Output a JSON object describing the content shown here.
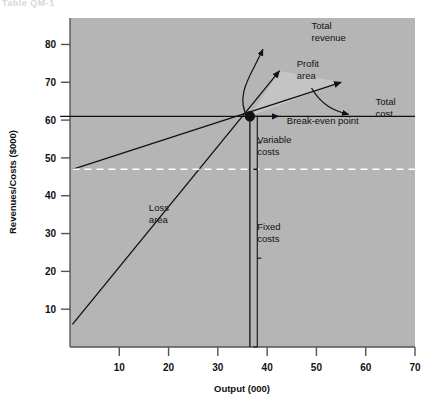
{
  "figure": {
    "ghost_caption": "Table QM-1"
  },
  "chart_data": {
    "type": "line",
    "title": "",
    "xlabel": "Output (000)",
    "ylabel": "Revenues/Costs ($000)",
    "xlim": [
      0,
      70
    ],
    "ylim": [
      0,
      87
    ],
    "xticks": [
      10,
      20,
      30,
      40,
      50,
      60,
      70
    ],
    "yticks": [
      10,
      20,
      30,
      40,
      50,
      60,
      70,
      80
    ],
    "grid": false,
    "legend": "none",
    "plot_background": "#b5b5b5",
    "series": [
      {
        "name": "Total revenue",
        "kind": "line",
        "x": [
          0.5,
          42.5
        ],
        "y": [
          6.0,
          73.0
        ],
        "arrow_end": true
      },
      {
        "name": "Total cost",
        "kind": "line",
        "x": [
          0.5,
          55.0
        ],
        "y": [
          47.0,
          70.0
        ],
        "arrow_end": true
      },
      {
        "name": "Fixed costs",
        "kind": "dashed-horizontal",
        "x": [
          0.5,
          70.0
        ],
        "y": [
          47.0,
          47.0
        ],
        "color": "#ffffff"
      },
      {
        "name": "Break-even revenue level",
        "kind": "horizontal",
        "x": [
          -2.0,
          70.0
        ],
        "y": [
          61.0,
          61.0
        ]
      },
      {
        "name": "Break-even output drop line",
        "kind": "vertical",
        "x": [
          36.5,
          36.5
        ],
        "y": [
          0.0,
          61.0
        ]
      }
    ],
    "points": [
      {
        "name": "Break-even point",
        "x": 36.5,
        "y": 61.0,
        "marker": "filled-circle"
      }
    ],
    "annotations": [
      {
        "name": "total-revenue-label",
        "text": "Total revenue",
        "lines": [
          "Total",
          "revenue"
        ],
        "x": 49,
        "y": 84
      },
      {
        "name": "profit-area-label",
        "text": "Profit area",
        "lines": [
          "Profit",
          "area"
        ],
        "x": 46,
        "y": 74
      },
      {
        "name": "total-cost-label",
        "text": "Total cost",
        "lines": [
          "Total",
          "cost"
        ],
        "x": 62,
        "y": 64
      },
      {
        "name": "break-even-label",
        "text": "Break-even point",
        "lines": [
          "Break-even point"
        ],
        "x": 44,
        "y": 59
      },
      {
        "name": "variable-costs-label",
        "text": "Variable costs",
        "lines": [
          "Variable",
          "costs"
        ],
        "x": 38,
        "y": 54
      },
      {
        "name": "fixed-costs-label",
        "text": "Fixed costs",
        "lines": [
          "Fixed",
          "costs"
        ],
        "x": 38,
        "y": 31
      },
      {
        "name": "loss-area-label",
        "text": "Loss area",
        "lines": [
          "Loss",
          "area"
        ],
        "x": 16,
        "y": 36
      }
    ],
    "brackets": [
      {
        "name": "variable-costs-bracket",
        "x": 38.0,
        "y_from": 47.0,
        "y_to": 61.0
      },
      {
        "name": "fixed-costs-bracket",
        "x": 38.0,
        "y_from": 0.0,
        "y_to": 47.0
      }
    ]
  }
}
